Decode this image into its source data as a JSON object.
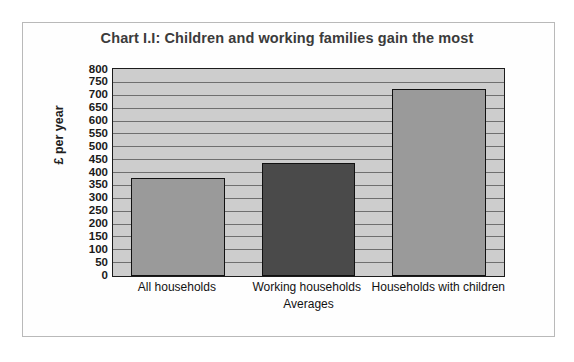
{
  "chart_data": {
    "type": "bar",
    "title": "Chart I.I: Children and working families gain the most",
    "xlabel": "Averages",
    "ylabel": "£ per year",
    "categories": [
      "All households",
      "Working households",
      "Households with children"
    ],
    "values": [
      380,
      440,
      725
    ],
    "series": [
      {
        "name": "Average gain",
        "values": [
          380,
          440,
          725
        ]
      }
    ],
    "ylim": [
      0,
      800
    ],
    "ytick_step": 50,
    "yticks": [
      800,
      750,
      700,
      650,
      600,
      550,
      500,
      450,
      400,
      350,
      300,
      250,
      200,
      150,
      100,
      50,
      0
    ],
    "grid": true,
    "legend": "none",
    "bar_colors": [
      "#9a9a9a",
      "#4a4a4a",
      "#9a9a9a"
    ],
    "plot_background": "#cdcdcd",
    "gridline_color": "#6f6f6f",
    "axis_color": "#1c1c1c",
    "title_color": "#3b3b3b"
  }
}
